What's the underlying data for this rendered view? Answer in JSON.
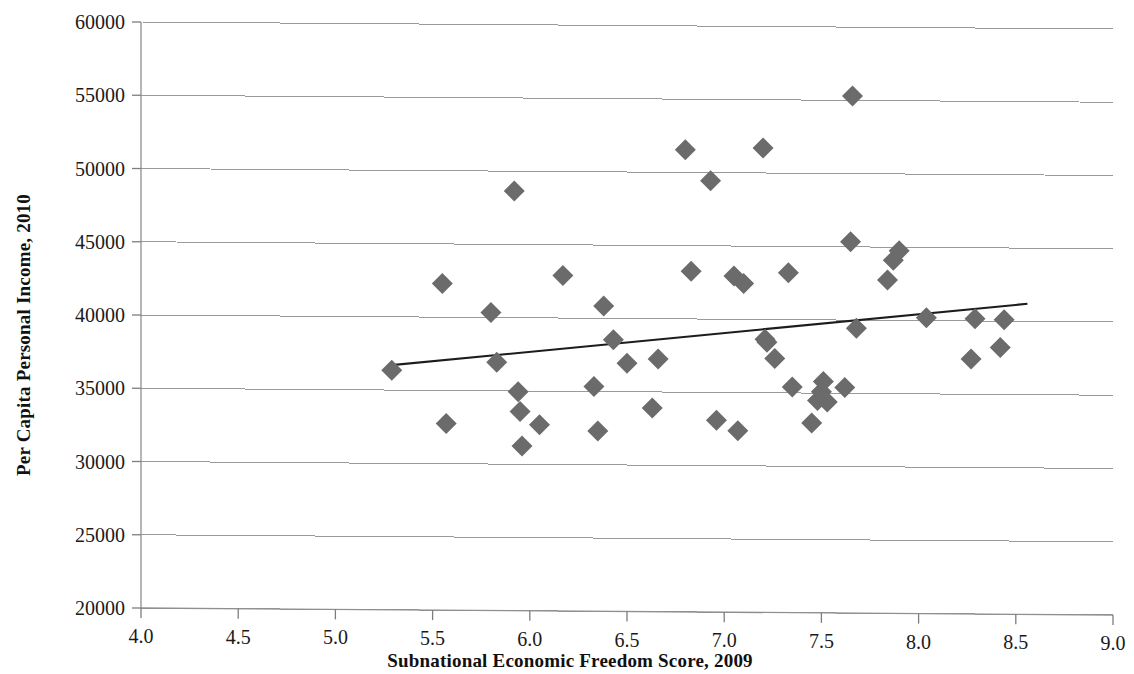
{
  "chart_data": {
    "type": "scatter",
    "title": "",
    "xlabel": "Subnational Economic Freedom Score, 2009",
    "ylabel": "Per Capita Personal Income, 2010",
    "xlim": [
      4.0,
      9.0
    ],
    "ylim": [
      20000,
      60000
    ],
    "xticks": [
      "4.0",
      "4.5",
      "5.0",
      "5.5",
      "6.0",
      "6.5",
      "7.0",
      "7.5",
      "8.0",
      "8.5",
      "9.0"
    ],
    "xtick_values": [
      4.0,
      4.5,
      5.0,
      5.5,
      6.0,
      6.5,
      7.0,
      7.5,
      8.0,
      8.5,
      9.0
    ],
    "yticks": [
      "20000",
      "25000",
      "30000",
      "35000",
      "40000",
      "45000",
      "50000",
      "55000",
      "60000"
    ],
    "ytick_values": [
      20000,
      25000,
      30000,
      35000,
      40000,
      45000,
      50000,
      55000,
      60000
    ],
    "grid": true,
    "legend": "none",
    "marker_shape": "diamond",
    "marker_color": "#6b6b6b",
    "trendline_color": "#1c1c1c",
    "gridline_color": "#9a9a9a",
    "series": [
      {
        "name": "States",
        "points": [
          [
            5.29,
            36350
          ],
          [
            5.55,
            42300
          ],
          [
            5.57,
            32750
          ],
          [
            5.8,
            40350
          ],
          [
            5.83,
            36950
          ],
          [
            5.92,
            48650
          ],
          [
            5.94,
            34950
          ],
          [
            5.95,
            33600
          ],
          [
            5.96,
            31250
          ],
          [
            6.05,
            32700
          ],
          [
            6.17,
            42900
          ],
          [
            6.33,
            35350
          ],
          [
            6.35,
            32300
          ],
          [
            6.38,
            40850
          ],
          [
            6.43,
            38550
          ],
          [
            6.5,
            36950
          ],
          [
            6.63,
            33900
          ],
          [
            6.66,
            37250
          ],
          [
            6.8,
            51550
          ],
          [
            6.83,
            43250
          ],
          [
            6.93,
            49450
          ],
          [
            6.96,
            33100
          ],
          [
            7.05,
            42950
          ],
          [
            7.07,
            32400
          ],
          [
            7.1,
            42450
          ],
          [
            7.2,
            51700
          ],
          [
            7.21,
            38650
          ],
          [
            7.22,
            38450
          ],
          [
            7.26,
            37350
          ],
          [
            7.33,
            43200
          ],
          [
            7.35,
            35400
          ],
          [
            7.45,
            32950
          ],
          [
            7.48,
            34500
          ],
          [
            7.5,
            35100
          ],
          [
            7.51,
            35800
          ],
          [
            7.53,
            34400
          ],
          [
            7.62,
            35400
          ],
          [
            7.65,
            45350
          ],
          [
            7.66,
            55300
          ],
          [
            7.68,
            39450
          ],
          [
            7.84,
            42750
          ],
          [
            7.87,
            44100
          ],
          [
            7.9,
            44750
          ],
          [
            8.04,
            40200
          ],
          [
            8.27,
            37400
          ],
          [
            8.29,
            40150
          ],
          [
            8.42,
            38200
          ],
          [
            8.44,
            40100
          ]
        ]
      }
    ],
    "trendline": {
      "x0": 5.29,
      "y0": 36700,
      "x1": 8.56,
      "y1": 41200
    }
  }
}
